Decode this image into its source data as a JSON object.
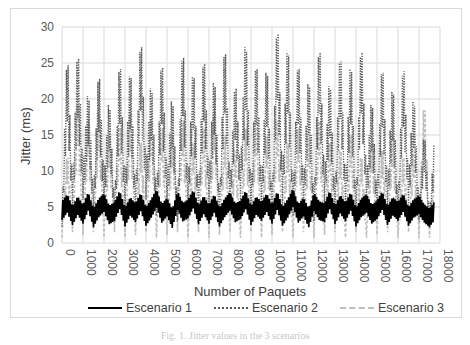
{
  "chart_data": {
    "type": "line",
    "title": "",
    "xlabel": "Number of Paquets",
    "ylabel": "Jitter  (ms)",
    "xlim": [
      0,
      18000
    ],
    "ylim": [
      0,
      30
    ],
    "grid": true,
    "legend_position": "bottom",
    "x_ticks": [
      "0",
      "1000",
      "2000",
      "3000",
      "4000",
      "5000",
      "6000",
      "7000",
      "8000",
      "9000",
      "10000",
      "11000",
      "12000",
      "13000",
      "14000",
      "15000",
      "16000",
      "17000",
      "18000"
    ],
    "y_ticks": [
      "0",
      "5",
      "10",
      "15",
      "20",
      "25",
      "30"
    ],
    "x": [
      0,
      250,
      500,
      750,
      1000,
      1250,
      1500,
      1750,
      2000,
      2250,
      2500,
      2750,
      3000,
      3250,
      3500,
      3750,
      4000,
      4250,
      4500,
      4750,
      5000,
      5250,
      5500,
      5750,
      6000,
      6250,
      6500,
      6750,
      7000,
      7250,
      7500,
      7750,
      8000,
      8250,
      8500,
      8750,
      9000,
      9250,
      9500,
      9750,
      10000,
      10250,
      10500,
      10750,
      11000,
      11250,
      11500,
      11750,
      12000,
      12250,
      12500,
      12750,
      13000,
      13250,
      13500,
      13750,
      14000,
      14250,
      14500,
      14750,
      15000,
      15250,
      15500,
      15750,
      16000,
      16250,
      16500,
      16750,
      17000,
      17250,
      17500,
      17750
    ],
    "series": [
      {
        "name": "Escenario 1",
        "style": "solid",
        "color": "#000000",
        "values": [
          4.5,
          5.5,
          3.8,
          5.2,
          4.0,
          5.8,
          3.5,
          4.9,
          5.6,
          3.9,
          4.4,
          6.0,
          3.6,
          5.1,
          4.2,
          5.7,
          3.7,
          4.8,
          6.2,
          4.1,
          5.0,
          3.4,
          5.9,
          4.3,
          4.7,
          6.1,
          3.9,
          5.3,
          4.0,
          5.5,
          3.6,
          4.9,
          5.8,
          4.2,
          4.6,
          6.0,
          3.8,
          5.2,
          4.4,
          5.6,
          4.0,
          5.9,
          3.7,
          4.8,
          6.3,
          4.1,
          5.0,
          3.5,
          5.7,
          4.5,
          4.2,
          6.0,
          3.9,
          5.4,
          4.3,
          5.8,
          3.6,
          4.9,
          5.5,
          4.0,
          4.6,
          5.9,
          3.8,
          5.1,
          4.4,
          5.6,
          3.7,
          4.8,
          5.3,
          4.1,
          3.5,
          4.5
        ]
      },
      {
        "name": "Escenario 2",
        "style": "dotted",
        "color": "#595959",
        "values": [
          3,
          22.5,
          6,
          23,
          8,
          18,
          5,
          20.5,
          7,
          17,
          4,
          22,
          6,
          21,
          5,
          24.5,
          8,
          19,
          5,
          22,
          7,
          17.5,
          4,
          23.5,
          6,
          21,
          5,
          22.5,
          7,
          20,
          4,
          24,
          6,
          19,
          8,
          24.5,
          5,
          22,
          6,
          21.5,
          4,
          26.5,
          7,
          24,
          5,
          22,
          6,
          20,
          4,
          24,
          7,
          19.5,
          5,
          23,
          6,
          22,
          4,
          24,
          7,
          17,
          5,
          21.5,
          6,
          19,
          4,
          21.5,
          7,
          17.5,
          4,
          13,
          3,
          12.5
        ]
      },
      {
        "name": "Escenario 3",
        "style": "dashed",
        "color": "#bfbfbf",
        "values": [
          1,
          11,
          2,
          18,
          1.5,
          16,
          2,
          17,
          1,
          14,
          2,
          15,
          1,
          17,
          1.5,
          13,
          2,
          16,
          1,
          15,
          1.5,
          14,
          2,
          16,
          1,
          13,
          2,
          15,
          1,
          17,
          1.5,
          14,
          2,
          12,
          1,
          15,
          2,
          16,
          1,
          14,
          1.5,
          16,
          2,
          13,
          1,
          15,
          2,
          14,
          1,
          16,
          1.5,
          13,
          2,
          12,
          1,
          14,
          2,
          11,
          1,
          13,
          1.5,
          12,
          2,
          14,
          1,
          11,
          2,
          12,
          1,
          17.5,
          1,
          9
        ]
      }
    ]
  },
  "axes": {
    "ylabel": "Jitter  (ms)",
    "xlabel": "Number of Paquets"
  },
  "legend": {
    "items": [
      "Escenario 1",
      "Escenario 2",
      "Escenario 3"
    ]
  },
  "caption": "Fig. 1.  Jitter values in the 3 scenarios"
}
